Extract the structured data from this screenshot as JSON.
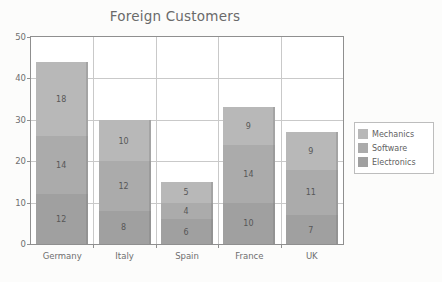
{
  "chart_data": {
    "type": "bar",
    "subtype": "stacked-bar",
    "title": "Foreign Customers",
    "xlabel": "",
    "ylabel": "",
    "ylim": [
      0,
      50
    ],
    "yticks": [
      0,
      10,
      20,
      30,
      40,
      50
    ],
    "ytick_labels": [
      "0",
      "10",
      "20",
      "30",
      "40",
      "50"
    ],
    "grid": true,
    "legend_position": "right",
    "categories": [
      "Germany",
      "Italy",
      "Spain",
      "France",
      "UK"
    ],
    "series": [
      {
        "name": "Electronics",
        "color": "#a0a0a0",
        "stack_order": 0,
        "values": [
          12,
          8,
          6,
          10,
          7
        ]
      },
      {
        "name": "Software",
        "color": "#ababab",
        "stack_order": 1,
        "values": [
          14,
          12,
          4,
          14,
          11
        ]
      },
      {
        "name": "Mechanics",
        "color": "#b8b8b8",
        "stack_order": 2,
        "values": [
          18,
          10,
          5,
          9,
          9
        ]
      }
    ],
    "totals": [
      44,
      30,
      15,
      33,
      27
    ],
    "data_labels": {
      "Germany": {
        "Mechanics": "18",
        "Software": "14",
        "Electronics": "12"
      },
      "Italy": {
        "Mechanics": "10",
        "Software": "12",
        "Electronics": "8"
      },
      "Spain": {
        "Mechanics": "5",
        "Software": "4",
        "Electronics": "6"
      },
      "France": {
        "Mechanics": "9",
        "Software": "14",
        "Electronics": "10"
      },
      "UK": {
        "Mechanics": "9",
        "Software": "11",
        "Electronics": "7"
      }
    }
  },
  "legend": {
    "entries": [
      {
        "label": "Mechanics",
        "color": "#b8b8b8"
      },
      {
        "label": "Software",
        "color": "#ababab"
      },
      {
        "label": "Electronics",
        "color": "#a0a0a0"
      }
    ]
  },
  "colors": {
    "background": "#fcfcfb",
    "plot_background": "#ffffff",
    "axis": "#8f8f8f",
    "gridline": "#c9c9c9",
    "text": "#6f6f6f",
    "title_text": "#6a6a6a"
  }
}
